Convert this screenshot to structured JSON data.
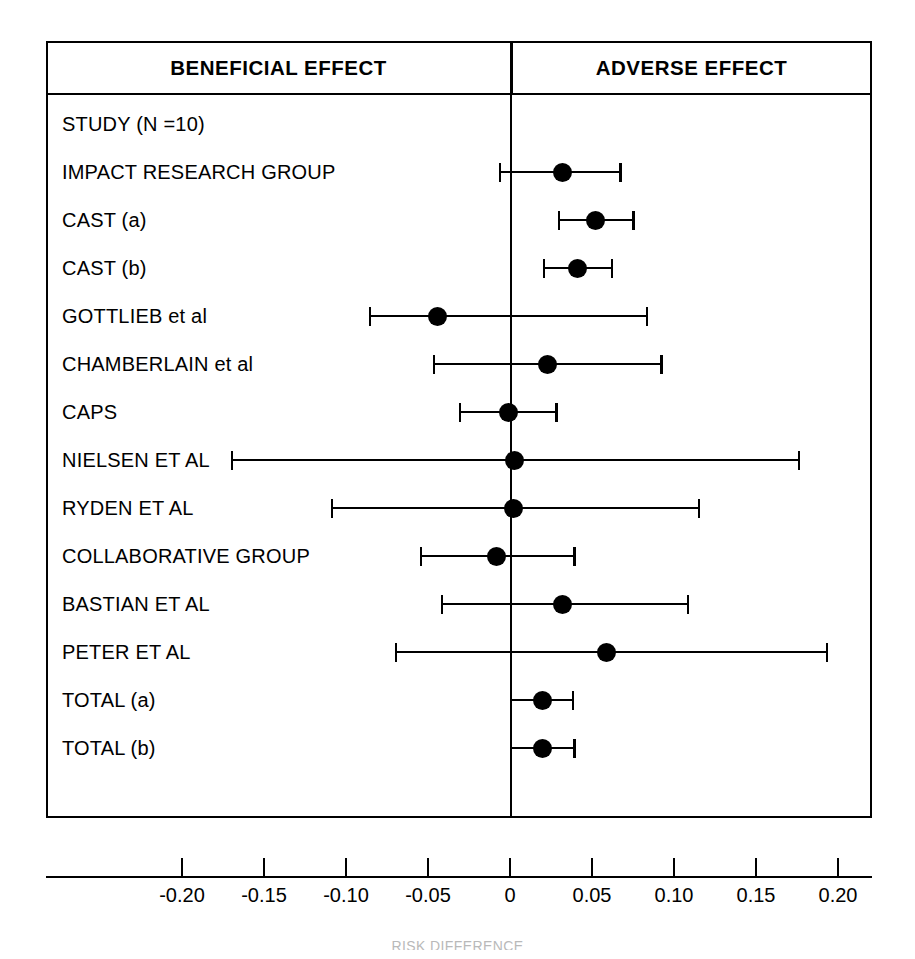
{
  "figure": {
    "headers": {
      "left": "BENEFICIAL EFFECT",
      "right": "ADVERSE EFFECT"
    },
    "caption": "RISK DIFFERENCE"
  },
  "chart_data": {
    "type": "scatter",
    "subtype": "forest-plot",
    "title": "",
    "xlabel": "RISK DIFFERENCE",
    "ylabel": "",
    "xlim": [
      -0.225,
      0.22
    ],
    "grid": false,
    "legend": null,
    "reference_line": 0,
    "left_region_label": "BENEFICIAL EFFECT",
    "right_region_label": "ADVERSE EFFECT",
    "xticks": [
      -0.2,
      -0.15,
      -0.1,
      -0.05,
      0,
      0.05,
      0.1,
      0.15,
      0.2
    ],
    "xticklabels": [
      "-0.20",
      "-0.15",
      "-0.10",
      "-0.05",
      "0",
      "0.05",
      "0.10",
      "0.15",
      "0.20"
    ],
    "header_row": "STUDY (N =10)",
    "rows": [
      {
        "label": "STUDY (N =10)",
        "has_marker": false,
        "estimate": null,
        "ci_low": null,
        "ci_high": null
      },
      {
        "label": "IMPACT RESEARCH GROUP",
        "has_marker": true,
        "estimate": 0.032,
        "ci_low": -0.007,
        "ci_high": 0.068
      },
      {
        "label": "CAST (a)",
        "has_marker": true,
        "estimate": 0.052,
        "ci_low": 0.029,
        "ci_high": 0.076
      },
      {
        "label": "CAST (b)",
        "has_marker": true,
        "estimate": 0.041,
        "ci_low": 0.02,
        "ci_high": 0.063
      },
      {
        "label": "GOTTLIEB et al",
        "has_marker": true,
        "estimate": -0.044,
        "ci_low": -0.086,
        "ci_high": 0.084
      },
      {
        "label": "CHAMBERLAIN et al",
        "has_marker": true,
        "estimate": 0.023,
        "ci_low": -0.047,
        "ci_high": 0.093
      },
      {
        "label": "CAPS",
        "has_marker": true,
        "estimate": -0.001,
        "ci_low": -0.031,
        "ci_high": 0.029
      },
      {
        "label": "NIELSEN ET AL",
        "has_marker": true,
        "estimate": 0.003,
        "ci_low": -0.17,
        "ci_high": 0.177
      },
      {
        "label": "RYDEN ET AL",
        "has_marker": true,
        "estimate": 0.002,
        "ci_low": -0.109,
        "ci_high": 0.116
      },
      {
        "label": "COLLABORATIVE GROUP",
        "has_marker": true,
        "estimate": -0.008,
        "ci_low": -0.055,
        "ci_high": 0.04
      },
      {
        "label": "BASTIAN ET AL",
        "has_marker": true,
        "estimate": 0.032,
        "ci_low": -0.042,
        "ci_high": 0.109
      },
      {
        "label": "PETER ET AL",
        "has_marker": true,
        "estimate": 0.059,
        "ci_low": -0.07,
        "ci_high": 0.194
      },
      {
        "label": "TOTAL (a)",
        "has_marker": true,
        "estimate": 0.02,
        "ci_low": 0.0,
        "ci_high": 0.039
      },
      {
        "label": "TOTAL (b)",
        "has_marker": true,
        "estimate": 0.02,
        "ci_low": 0.0,
        "ci_high": 0.04
      }
    ]
  }
}
